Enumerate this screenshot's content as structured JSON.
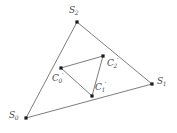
{
  "figure": {
    "background_color": "#ffffff",
    "stroke_color": "#6e6e6e",
    "marker_color": "#1a1a1a",
    "label_color": "#4a4a4a",
    "width": 177,
    "height": 133
  },
  "diagram": {
    "type": "geometric-triangle-nested",
    "outer_triangle": {
      "name": "outer-triangle",
      "vertices": [
        {
          "id": "S0",
          "base": "S",
          "sub": "0",
          "prime": false,
          "x": 26,
          "y": 118,
          "label_x": 9,
          "label_y": 111
        },
        {
          "id": "S1",
          "base": "S",
          "sub": "1",
          "prime": false,
          "x": 152,
          "y": 84,
          "label_x": 157,
          "label_y": 77
        },
        {
          "id": "S2",
          "base": "S",
          "sub": "2",
          "prime": false,
          "x": 77,
          "y": 22,
          "label_x": 69,
          "label_y": 6
        }
      ],
      "edges": [
        {
          "from": "S0",
          "to": "S2"
        },
        {
          "from": "S2",
          "to": "S1"
        },
        {
          "from": "S1",
          "to": "S0"
        }
      ]
    },
    "inner_triangle": {
      "name": "inner-triangle",
      "vertices": [
        {
          "id": "C0p",
          "base": "C",
          "sub": "0",
          "prime": true,
          "x": 61,
          "y": 68,
          "label_x": 52,
          "label_y": 74
        },
        {
          "id": "C1p",
          "base": "C",
          "sub": "1",
          "prime": true,
          "x": 92,
          "y": 96,
          "label_x": 95,
          "label_y": 83
        },
        {
          "id": "C2p",
          "base": "C",
          "sub": "2",
          "prime": true,
          "x": 103,
          "y": 56,
          "label_x": 107,
          "label_y": 59
        }
      ],
      "edges": [
        {
          "from": "C0p",
          "to": "C2p"
        },
        {
          "from": "C2p",
          "to": "C1p"
        },
        {
          "from": "C1p",
          "to": "C0p"
        }
      ]
    }
  },
  "labels": {
    "S0": {
      "base": "S",
      "sub": "0",
      "prime": ""
    },
    "S1": {
      "base": "S",
      "sub": "1",
      "prime": ""
    },
    "S2": {
      "base": "S",
      "sub": "2",
      "prime": ""
    },
    "C0p": {
      "base": "C",
      "sub": "0",
      "prime": "′"
    },
    "C1p": {
      "base": "C",
      "sub": "1",
      "prime": "′"
    },
    "C2p": {
      "base": "C",
      "sub": "2",
      "prime": "′"
    }
  }
}
